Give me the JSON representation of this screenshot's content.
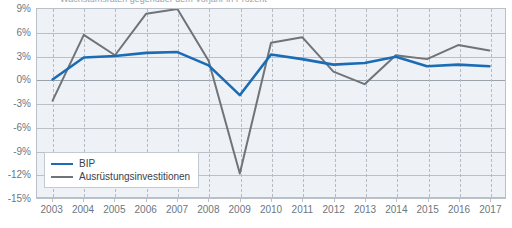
{
  "caption_sliver": "Wachstumsraten gegenüber dem Vorjahr in Prozent",
  "legend": {
    "position": "inside-bottom-left",
    "items": [
      {
        "label": "BIP",
        "color": "#1b6cb5"
      },
      {
        "label": "Ausrüstungsinvestitionen",
        "color": "#6e7478"
      }
    ]
  },
  "axis": {
    "ylabels": [
      "9%",
      "6%",
      "3%",
      "0%",
      "-3%",
      "-6%",
      "-9%",
      "-12%",
      "-15%"
    ],
    "yvalues": [
      9,
      6,
      3,
      0,
      -3,
      -6,
      -9,
      -12,
      -15
    ],
    "xlabels": [
      "2003",
      "2004",
      "2005",
      "2006",
      "2007",
      "2008",
      "2009",
      "2010",
      "2011",
      "2012",
      "2013",
      "2014",
      "2015",
      "2016",
      "2017"
    ]
  },
  "colors": {
    "bip": "#1b6cb5",
    "ausruestung": "#6e7478",
    "plot_background": "#eef1f5",
    "gridline": "#b9c0c7",
    "vgridline": "#b3bcc4",
    "axis_text": "#6d7680",
    "page_background": "#ffffff"
  },
  "chart_data": {
    "type": "line",
    "title": "",
    "subtitle": "",
    "xlabel": "",
    "ylabel": "",
    "x": [
      "2003",
      "2004",
      "2005",
      "2006",
      "2007",
      "2008",
      "2009",
      "2010",
      "2011",
      "2012",
      "2013",
      "2014",
      "2015",
      "2016",
      "2017"
    ],
    "ylim": [
      -15,
      9
    ],
    "yticks": [
      9,
      6,
      3,
      0,
      -3,
      -6,
      -9,
      -12,
      -15
    ],
    "ytick_labels": [
      "9%",
      "6%",
      "3%",
      "0%",
      "-3%",
      "-6%",
      "-9%",
      "-12%",
      "-15%"
    ],
    "grid": {
      "horizontal": true,
      "vertical": true,
      "vertical_style": "dashed"
    },
    "legend_position": "inside bottom-left",
    "units": "percent",
    "series": [
      {
        "name": "BIP",
        "color": "#1b6cb5",
        "values": [
          0.0,
          2.8,
          3.0,
          3.4,
          3.5,
          1.8,
          -2.0,
          3.2,
          2.6,
          1.9,
          2.1,
          2.9,
          1.7,
          1.9,
          1.7
        ]
      },
      {
        "name": "Ausrüstungsinvestitionen",
        "color": "#6e7478",
        "values": [
          -2.7,
          5.7,
          3.1,
          8.4,
          9.0,
          2.4,
          -12.0,
          4.7,
          5.4,
          1.0,
          -0.6,
          3.1,
          2.6,
          4.4,
          3.7
        ]
      }
    ]
  }
}
